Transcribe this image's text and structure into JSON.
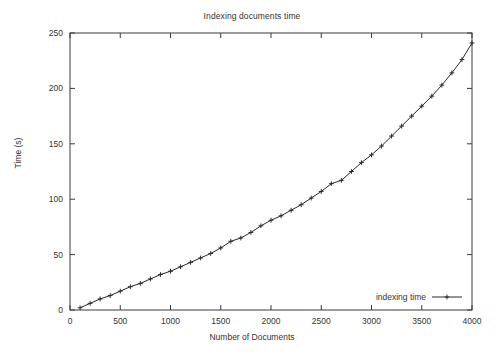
{
  "chart_data": {
    "type": "line",
    "title": "Indexing documents time",
    "xlabel": "Number of Documents",
    "ylabel": "Time (s)",
    "xlim": [
      0,
      4000
    ],
    "ylim": [
      0,
      250
    ],
    "xticks": [
      0,
      500,
      1000,
      1500,
      2000,
      2500,
      3000,
      3500,
      4000
    ],
    "xtick_labels": [
      "0",
      "500",
      "1000",
      "1500",
      "2000",
      "2500",
      "3000",
      "3500",
      "4000"
    ],
    "yticks": [
      0,
      50,
      100,
      150,
      200,
      250
    ],
    "ytick_labels": [
      "0",
      "50",
      "100",
      "150",
      "200",
      "250"
    ],
    "grid": false,
    "legend_position": "bottom-right",
    "marker": "plus",
    "line_color": "#2a2a2a",
    "series": [
      {
        "name": "indexing time",
        "x": [
          100,
          200,
          300,
          400,
          500,
          600,
          700,
          800,
          900,
          1000,
          1100,
          1200,
          1300,
          1400,
          1500,
          1600,
          1700,
          1800,
          1900,
          2000,
          2100,
          2200,
          2300,
          2400,
          2500,
          2600,
          2700,
          2800,
          2900,
          3000,
          3100,
          3200,
          3300,
          3400,
          3500,
          3600,
          3700,
          3800,
          3900,
          4000
        ],
        "values": [
          2,
          6,
          10,
          13,
          17,
          21,
          24,
          28,
          32,
          35,
          39,
          43,
          47,
          51,
          56,
          62,
          65,
          70,
          76,
          81,
          85,
          90,
          95,
          101,
          107,
          114,
          117,
          125,
          133,
          140,
          148,
          157,
          166,
          175,
          184,
          193,
          203,
          214,
          226,
          241
        ]
      }
    ]
  },
  "legend": {
    "entries": [
      {
        "label": "indexing time"
      }
    ]
  }
}
